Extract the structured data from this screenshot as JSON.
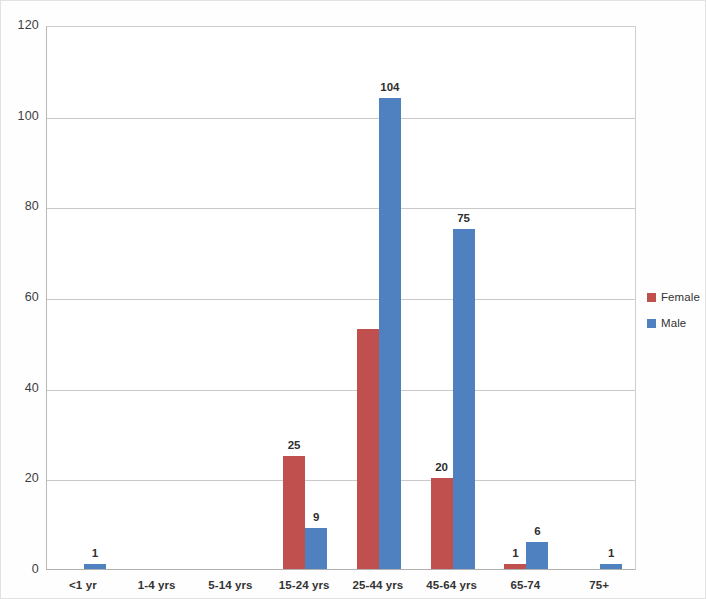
{
  "chart_data": {
    "type": "bar",
    "title": "",
    "subtitle": "",
    "xlabel": "",
    "ylabel": "",
    "categories": [
      "<1 yr",
      "1-4 yrs",
      "5-14 yrs",
      "15-24 yrs",
      "25-44 yrs",
      "45-64 yrs",
      "65-74",
      "75+"
    ],
    "series": [
      {
        "name": "Female",
        "color": "#c0504d",
        "values": [
          0,
          0,
          0,
          25,
          53,
          20,
          1,
          0
        ],
        "data_labels": [
          "",
          "",
          "",
          "25",
          "",
          "20",
          "1",
          ""
        ]
      },
      {
        "name": "Male",
        "color": "#4f81c1",
        "values": [
          1,
          0,
          0,
          9,
          104,
          75,
          6,
          1
        ],
        "data_labels": [
          "1",
          "",
          "",
          "9",
          "104",
          "75",
          "6",
          "1"
        ]
      }
    ],
    "ylim": [
      0,
      120
    ],
    "yticks": [
      0,
      20,
      40,
      60,
      80,
      100,
      120
    ],
    "ytick_labels": [
      "0",
      "20",
      "40",
      "60",
      "80",
      "100",
      "120"
    ],
    "grid": true,
    "grid_axis": "y",
    "legend_position": "right"
  },
  "legend": {
    "entries": [
      {
        "label": "Female",
        "color": "#c0504d"
      },
      {
        "label": "Male",
        "color": "#4f81c1"
      }
    ]
  },
  "axis": {
    "y_labels": [
      "120",
      "100",
      "80",
      "60",
      "40",
      "20",
      "0"
    ],
    "x_labels": [
      "<1 yr",
      "1-4 yrs",
      "5-14 yrs",
      "15-24 yrs",
      "25-44 yrs",
      "45-64 yrs",
      "65-74",
      "75+"
    ]
  }
}
